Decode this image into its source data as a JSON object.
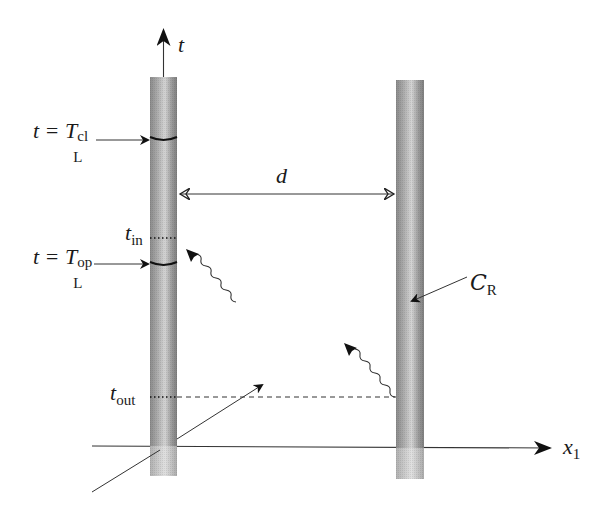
{
  "diagram": {
    "type": "spacetime-diagram",
    "axes": {
      "time": {
        "label": "t"
      },
      "space": {
        "label_main": "x",
        "label_sub": "1"
      }
    },
    "cylinders": [
      {
        "id": "left",
        "name": "Lab L"
      },
      {
        "id": "right",
        "name": "C_R",
        "label_main": "C",
        "label_sub": "R"
      }
    ],
    "separation": {
      "label": "d"
    },
    "labels": {
      "t_closed": {
        "lhs": "t = ",
        "T": "T",
        "sub": "L",
        "sup": "cl"
      },
      "t_open": {
        "lhs": "t = ",
        "T": "T",
        "sub": "L",
        "sup": "op"
      },
      "t_in": {
        "main": "t",
        "sub": "in"
      },
      "t_out": {
        "main": "t",
        "sub": "out"
      }
    },
    "signals": [
      {
        "kind": "wavy",
        "description": "signal arriving at left cylinder after t_in"
      },
      {
        "kind": "wavy",
        "description": "signal emitted from right cylinder at t_out"
      },
      {
        "kind": "straight",
        "description": "worldline crossing left cylinder"
      }
    ],
    "colors": {
      "ink": "#1a1a1a",
      "cylinder_dark": "#7a7a7a",
      "cylinder_light": "#d6d6d6"
    }
  }
}
